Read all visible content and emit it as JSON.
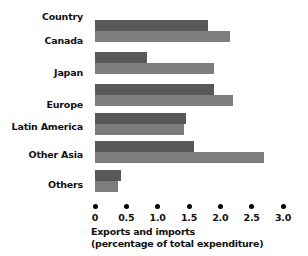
{
  "chart_data": {
    "type": "bar",
    "orientation": "horizontal",
    "title": "",
    "subtitle": "",
    "xlabel": "Exports and imports (percentage of total expenditure)",
    "xlabel_lines": [
      "Exports and imports",
      "(percentage of total expenditure)"
    ],
    "ylabel": "Country",
    "categories": [
      "Canada",
      "Japan",
      "Europe",
      "Latin America",
      "Other Asia",
      "Others"
    ],
    "series": [
      {
        "name": "Exports",
        "values": [
          1.8,
          0.83,
          1.9,
          1.45,
          1.58,
          0.41
        ]
      },
      {
        "name": "Imports",
        "values": [
          2.15,
          1.9,
          2.2,
          1.42,
          2.7,
          0.37
        ]
      }
    ],
    "xlim": [
      0,
      3.0
    ],
    "xticks": [
      0,
      0.5,
      1.0,
      1.5,
      2.0,
      2.5,
      3.0
    ],
    "xtick_labels": [
      "0",
      "0.5",
      "1.0",
      "1.5",
      "2.0",
      "2.5",
      "3.0"
    ],
    "grid": false,
    "legend": "none",
    "colors": {
      "exports": "#585858",
      "imports": "#7d7d7d",
      "text": "#111111",
      "background": "#ffffff"
    }
  },
  "axis": {
    "tick_marker": "dot"
  }
}
